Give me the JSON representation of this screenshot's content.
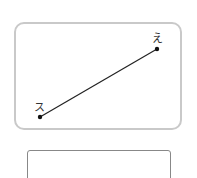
{
  "diagram": {
    "points": [
      {
        "id": "start",
        "label": "ス",
        "x": 40,
        "y": 117
      },
      {
        "id": "end",
        "label": "え",
        "x": 157,
        "y": 49
      }
    ],
    "line_color": "#222222",
    "card_border_color": "#c9c9c9"
  },
  "answer_box": {
    "value": ""
  }
}
